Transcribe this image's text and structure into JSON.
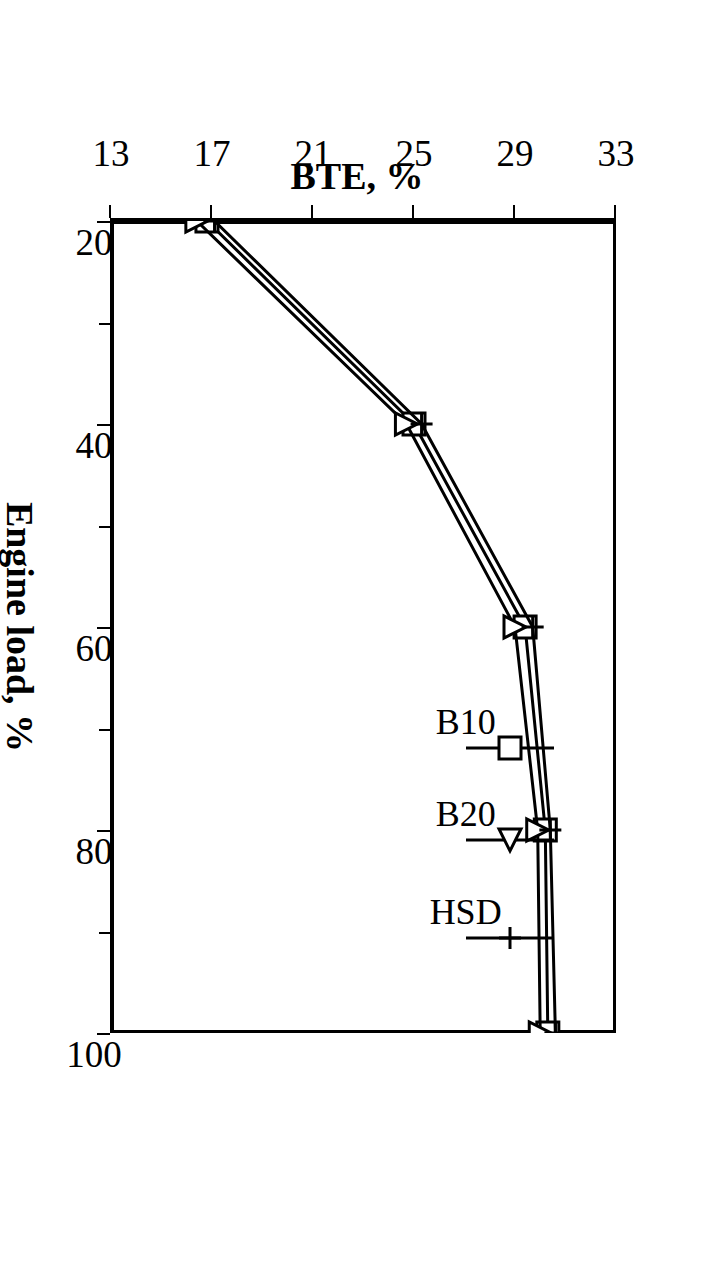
{
  "figure": {
    "rotation_degrees": 90,
    "background_color": "#ffffff",
    "line_color": "#000000"
  },
  "chart_data": {
    "type": "line",
    "title": "",
    "xlabel": "Engine load, %",
    "ylabel": "BTE, %",
    "xlim": [
      20,
      100
    ],
    "ylim": [
      13,
      33
    ],
    "xticks": [
      20,
      40,
      60,
      80,
      100
    ],
    "xtick_labels": [
      "20",
      "40",
      "60",
      "80",
      "100"
    ],
    "yticks": [
      13,
      17,
      21,
      25,
      29,
      33
    ],
    "ytick_labels": [
      "13",
      "17",
      "21",
      "25",
      "29",
      "33"
    ],
    "x_minor_ticks": [
      30,
      50,
      70,
      90
    ],
    "grid": false,
    "legend_position": "upper-left-inside",
    "x": [
      20,
      40,
      60,
      80,
      100
    ],
    "series": [
      {
        "name": "B10",
        "marker": "square",
        "values": [
          16.8,
          25.0,
          29.4,
          30.2,
          30.3
        ]
      },
      {
        "name": "B20",
        "marker": "triangle",
        "values": [
          16.4,
          24.7,
          29.0,
          29.9,
          30.0
        ]
      },
      {
        "name": "HSD",
        "marker": "plus",
        "values": [
          17.1,
          25.3,
          29.7,
          30.4,
          30.6
        ]
      }
    ]
  },
  "legend": {
    "items": [
      {
        "label": "B10",
        "marker": "square"
      },
      {
        "label": "B20",
        "marker": "triangle"
      },
      {
        "label": "HSD",
        "marker": "plus"
      }
    ]
  }
}
